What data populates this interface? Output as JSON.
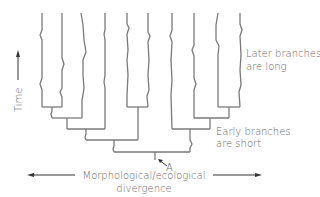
{
  "diagram": {
    "type": "phylogenetic-tree",
    "axis_time": {
      "label": "Time"
    },
    "axis_divergence": {
      "label_line1": "Morphological/ecological",
      "label_line2": "divergence"
    },
    "annotations": {
      "later": {
        "line1": "Later branches",
        "line2": "are long"
      },
      "early": {
        "line1": "Early branches",
        "line2": "are short"
      },
      "node_label": "A"
    },
    "colors": {
      "line": "#777777",
      "text": "#666666"
    }
  }
}
